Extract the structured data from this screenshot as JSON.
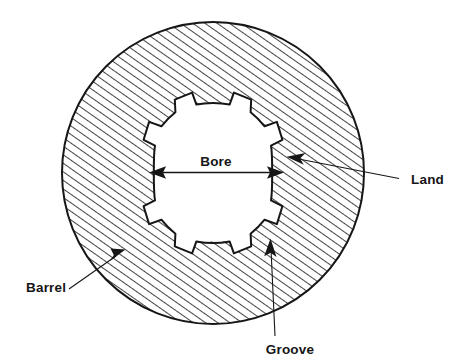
{
  "labels": {
    "bore": "Bore",
    "land": "Land",
    "groove": "Groove",
    "barrel": "Barrel"
  },
  "colors": {
    "ink": "#161616",
    "background": "#ffffff",
    "hatch": "#2a2a2a"
  },
  "geometry": {
    "outer_circle": {
      "cx": 213,
      "cy": 173,
      "r": 151
    },
    "bore": {
      "cx": 213,
      "cy": 173,
      "groove_radius": 86,
      "land_radius": 70,
      "count": 8
    },
    "bore_dimension": {
      "x1": 150,
      "x2": 283,
      "y": 172
    }
  },
  "annotations": [
    {
      "name": "bore",
      "label": "Bore",
      "kind": "dimension",
      "text_x": 216,
      "text_y": 166
    },
    {
      "name": "land",
      "label": "Land",
      "kind": "leader",
      "text_x": 411,
      "text_y": 184
    },
    {
      "name": "groove",
      "label": "Groove",
      "kind": "leader",
      "text_x": 290,
      "text_y": 354
    },
    {
      "name": "barrel",
      "label": "Barrel",
      "kind": "leader",
      "text_x": 26,
      "text_y": 292
    }
  ]
}
